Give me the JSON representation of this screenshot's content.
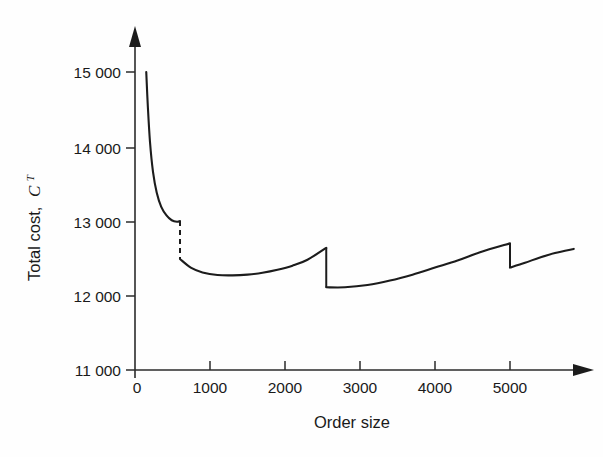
{
  "figure": {
    "background_color": "#fefefe",
    "line_color": "#1c1c1c",
    "axis_color": "#2b2b2b"
  },
  "axes": {
    "y": {
      "title_text": "Total cost,",
      "title_symbol": "C",
      "title_superscript": "T",
      "tick_labels": [
        "15 000",
        "14 000",
        "13 000",
        "12 000",
        "11 000"
      ],
      "tick_values": [
        15000,
        14000,
        13000,
        12000,
        11000
      ]
    },
    "x": {
      "title": "Order size",
      "tick_labels": [
        "0",
        "1000",
        "2000",
        "3000",
        "4000",
        "5000"
      ],
      "tick_values": [
        0,
        1000,
        2000,
        3000,
        4000,
        5000
      ]
    }
  },
  "chart_data": {
    "type": "line",
    "title": "",
    "subtitle": "",
    "xlabel": "Order size",
    "ylabel": "Total cost, C^T",
    "xlim": [
      0,
      5900
    ],
    "ylim": [
      11000,
      15200
    ],
    "grid": false,
    "legend": null,
    "price_breaks": [
      600,
      2550,
      5000
    ],
    "discontinuities": [
      {
        "x": 600,
        "y_before": 13000,
        "y_after": 12490,
        "style": "dashed"
      },
      {
        "x": 2550,
        "y_before": 12640,
        "y_after": 12110,
        "style": "solid"
      },
      {
        "x": 5000,
        "y_before": 12700,
        "y_after": 12375,
        "style": "solid"
      }
    ],
    "series": [
      {
        "name": "Segment 1 (order size 150-600)",
        "x": [
          150,
          170,
          200,
          240,
          290,
          350,
          420,
          490,
          560,
          600
        ],
        "values": [
          15000,
          14560,
          14060,
          13660,
          13380,
          13190,
          13075,
          13010,
          12990,
          13000
        ]
      },
      {
        "name": "Segment 2 (order size 600-2550)",
        "x": [
          600,
          750,
          900,
          1100,
          1300,
          1500,
          1700,
          1900,
          2100,
          2300,
          2550
        ],
        "values": [
          12490,
          12370,
          12310,
          12275,
          12270,
          12280,
          12305,
          12345,
          12400,
          12480,
          12640
        ]
      },
      {
        "name": "Segment 3 (order size 2550-5000)",
        "x": [
          2550,
          2800,
          3100,
          3400,
          3700,
          4000,
          4300,
          4600,
          5000
        ],
        "values": [
          12110,
          12110,
          12140,
          12200,
          12280,
          12375,
          12470,
          12580,
          12700
        ]
      },
      {
        "name": "Segment 4 (order size 5000-5850)",
        "x": [
          5000,
          5200,
          5400,
          5600,
          5850
        ],
        "values": [
          12375,
          12440,
          12510,
          12570,
          12625
        ]
      }
    ],
    "minimum_point": {
      "x": 1350,
      "y": 12270
    }
  }
}
